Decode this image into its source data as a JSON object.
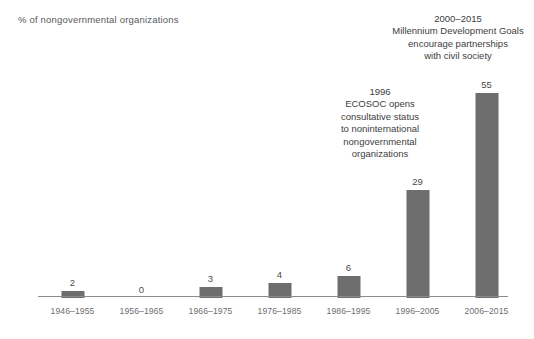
{
  "chart_data": {
    "type": "bar",
    "title": "",
    "subtitle": "",
    "xlabel": "",
    "ylabel": "% of nongovernmental organizations",
    "categories": [
      "1946–1955",
      "1956–1965",
      "1966–1975",
      "1976–1985",
      "1986–1995",
      "1996–2005",
      "2006–2015"
    ],
    "values": [
      2,
      0,
      3,
      4,
      6,
      29,
      55
    ],
    "value_labels": [
      "2",
      "0",
      "3",
      "4",
      "6",
      "29",
      "55"
    ],
    "ylim": [
      0,
      58
    ],
    "grid": false,
    "legend": null,
    "bar_color": "#6e6e6e",
    "annotations": [
      {
        "id": "ecosoc",
        "attached_to_category": "1996–2005",
        "text": "1996\nECOSOC opens\nconsultative status\nto noninternational\nnongovernmental\norganizations"
      },
      {
        "id": "mdg",
        "attached_to_category": "2006–2015",
        "text": "2000–2015\nMillennium Development Goals\nencourage partnerships\nwith civil society"
      }
    ]
  },
  "colors": {
    "bar": "#6e6e6e",
    "axis_line": "#8b8c8e",
    "axis_label_text": "#58595b",
    "category_text": "#6d6e70",
    "value_text": "#4a4a4c",
    "annotation_text": "#404041",
    "background": "#ffffff"
  }
}
